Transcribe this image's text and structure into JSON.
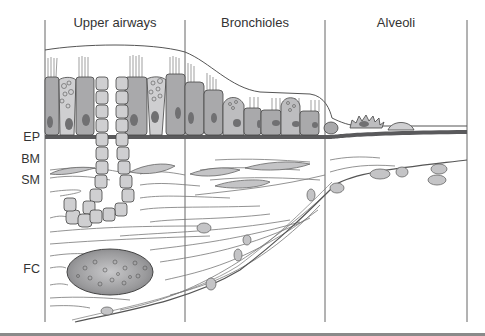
{
  "diagram": {
    "regions": [
      {
        "label": "Upper airways",
        "x_center": 115
      },
      {
        "label": "Bronchioles",
        "x_center": 255
      },
      {
        "label": "Alveoli",
        "x_center": 396
      }
    ],
    "layers": [
      {
        "abbr": "EP",
        "y": 137
      },
      {
        "abbr": "BM",
        "y": 160
      },
      {
        "abbr": "SM",
        "y": 181
      },
      {
        "abbr": "FC",
        "y": 270
      }
    ],
    "dividers_x": [
      45,
      185,
      325,
      467
    ],
    "colors": {
      "line": "#555555",
      "cell_fill": "#a9a9ab",
      "cell_light": "#cfcfd1",
      "nucleus": "#707072",
      "basement": "#5a5a5c",
      "bottom_rule": "#8a8a8a"
    }
  }
}
